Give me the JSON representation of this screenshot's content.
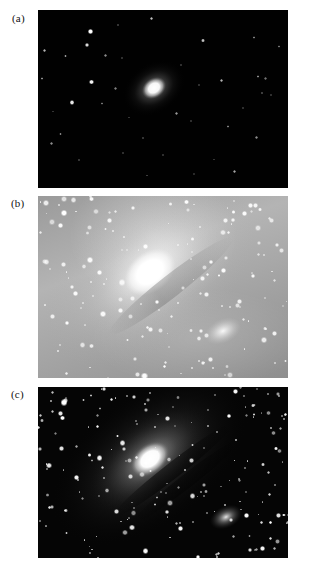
{
  "figure": {
    "background_color": "#ffffff",
    "panels": [
      {
        "id": "a",
        "label": "(a)",
        "description": "short exposure — only the bright nucleus and brightest foreground stars visible against a black sky",
        "sky_color": "#010101",
        "core_color": "#ffffff",
        "x": 38,
        "y": 10,
        "width": 250,
        "height": 178,
        "galaxy": {
          "core_cx_pct": 46.5,
          "core_cy_pct": 44.0,
          "core_rx_px": 11,
          "core_ry_px": 9,
          "halo_rx_px": 33,
          "halo_ry_px": 25,
          "tilt_deg": -35
        },
        "stars": [
          {
            "x": 21.0,
            "y": 12.0,
            "r": 2.8,
            "b": 1.0
          },
          {
            "x": 19.5,
            "y": 19.5,
            "r": 2.0,
            "b": 0.85
          },
          {
            "x": 11.0,
            "y": 26.0,
            "r": 1.2,
            "b": 0.6
          },
          {
            "x": 2.5,
            "y": 22.5,
            "r": 1.5,
            "b": 0.7
          },
          {
            "x": 1.5,
            "y": 38.5,
            "r": 1.2,
            "b": 0.55
          },
          {
            "x": 32.0,
            "y": 8.5,
            "r": 1.0,
            "b": 0.45
          },
          {
            "x": 45.5,
            "y": 5.0,
            "r": 1.6,
            "b": 0.75
          },
          {
            "x": 27.0,
            "y": 25.5,
            "r": 1.3,
            "b": 0.55
          },
          {
            "x": 33.5,
            "y": 27.0,
            "r": 0.9,
            "b": 0.4
          },
          {
            "x": 21.5,
            "y": 40.5,
            "r": 2.4,
            "b": 0.95
          },
          {
            "x": 31.0,
            "y": 44.0,
            "r": 1.2,
            "b": 0.5
          },
          {
            "x": 25.5,
            "y": 52.5,
            "r": 1.1,
            "b": 0.45
          },
          {
            "x": 13.5,
            "y": 52.0,
            "r": 2.2,
            "b": 0.9
          },
          {
            "x": 9.0,
            "y": 69.5,
            "r": 1.2,
            "b": 0.5
          },
          {
            "x": 5.5,
            "y": 75.0,
            "r": 1.3,
            "b": 0.55
          },
          {
            "x": 16.5,
            "y": 84.5,
            "r": 1.1,
            "b": 0.45
          },
          {
            "x": 34.0,
            "y": 80.5,
            "r": 1.0,
            "b": 0.4
          },
          {
            "x": 42.0,
            "y": 72.0,
            "r": 1.1,
            "b": 0.45
          },
          {
            "x": 55.5,
            "y": 58.0,
            "r": 1.4,
            "b": 0.6
          },
          {
            "x": 50.0,
            "y": 81.5,
            "r": 1.0,
            "b": 0.4
          },
          {
            "x": 66.0,
            "y": 17.0,
            "r": 1.7,
            "b": 0.75
          },
          {
            "x": 64.5,
            "y": 42.0,
            "r": 1.0,
            "b": 0.4
          },
          {
            "x": 73.5,
            "y": 39.5,
            "r": 1.6,
            "b": 0.7
          },
          {
            "x": 88.0,
            "y": 37.5,
            "r": 1.3,
            "b": 0.55
          },
          {
            "x": 91.0,
            "y": 38.5,
            "r": 1.1,
            "b": 0.45
          },
          {
            "x": 89.5,
            "y": 46.5,
            "r": 1.2,
            "b": 0.5
          },
          {
            "x": 93.0,
            "y": 48.0,
            "r": 1.0,
            "b": 0.4
          },
          {
            "x": 86.5,
            "y": 15.5,
            "r": 1.2,
            "b": 0.5
          },
          {
            "x": 96.5,
            "y": 20.5,
            "r": 1.1,
            "b": 0.45
          },
          {
            "x": 82.0,
            "y": 55.0,
            "r": 1.0,
            "b": 0.4
          },
          {
            "x": 76.0,
            "y": 65.5,
            "r": 1.2,
            "b": 0.5
          },
          {
            "x": 87.5,
            "y": 71.5,
            "r": 1.3,
            "b": 0.55
          },
          {
            "x": 78.5,
            "y": 90.5,
            "r": 1.5,
            "b": 0.65
          },
          {
            "x": 61.0,
            "y": 62.5,
            "r": 1.0,
            "b": 0.4
          },
          {
            "x": 57.0,
            "y": 31.0,
            "r": 1.0,
            "b": 0.4
          },
          {
            "x": 62.5,
            "y": 92.0,
            "r": 0.9,
            "b": 0.35
          },
          {
            "x": 43.5,
            "y": 93.0,
            "r": 0.9,
            "b": 0.35
          },
          {
            "x": 6.0,
            "y": 57.0,
            "r": 0.8,
            "b": 0.3
          },
          {
            "x": 36.5,
            "y": 60.5,
            "r": 0.8,
            "b": 0.3
          },
          {
            "x": 70.5,
            "y": 84.0,
            "r": 0.8,
            "b": 0.3
          }
        ]
      },
      {
        "id": "b",
        "label": "(b)",
        "description": "long overexposed exposure — washed-out grey sky, galaxy disk saturated, dense field of stars",
        "sky_color": "#a8a8a8",
        "core_color": "#ffffff",
        "x": 38,
        "y": 196,
        "width": 250,
        "height": 182,
        "galaxy": {
          "core_cx_pct": 45.0,
          "core_cy_pct": 42.0,
          "core_rx_px": 26,
          "core_ry_px": 19,
          "halo_rx_px": 120,
          "halo_ry_px": 74,
          "tilt_deg": -38
        },
        "companion": {
          "x_pct": 74.0,
          "y_pct": 74.0,
          "rx_px": 18,
          "ry_px": 11
        },
        "star_count": 150,
        "star_color": "#ffffff"
      },
      {
        "id": "c",
        "label": "(c)",
        "description": "correct exposure — spiral arms, dust lanes and two companion galaxies visible on a dark sky",
        "sky_color": "#050505",
        "core_color": "#ffffff",
        "x": 38,
        "y": 387,
        "width": 250,
        "height": 171,
        "galaxy": {
          "core_cx_pct": 45.0,
          "core_cy_pct": 42.0,
          "core_rx_px": 20,
          "core_ry_px": 14,
          "halo_rx_px": 112,
          "halo_ry_px": 66,
          "tilt_deg": -38
        },
        "companion": {
          "x_pct": 75.0,
          "y_pct": 76.0,
          "rx_px": 16,
          "ry_px": 10
        },
        "bright_stars": [
          {
            "x": 10.5,
            "y": 9.0,
            "r": 3.2,
            "b": 1.0
          },
          {
            "x": 9.0,
            "y": 15.5,
            "r": 2.4,
            "b": 0.9
          },
          {
            "x": 1.5,
            "y": 19.5,
            "r": 1.8,
            "b": 0.7
          },
          {
            "x": 24.5,
            "y": 41.5,
            "r": 2.6,
            "b": 0.95
          },
          {
            "x": 15.5,
            "y": 53.0,
            "r": 2.6,
            "b": 0.95
          },
          {
            "x": 38.5,
            "y": 6.0,
            "r": 2.0,
            "b": 0.8
          },
          {
            "x": 77.0,
            "y": 77.5,
            "r": 2.0,
            "b": 0.8
          }
        ],
        "star_count": 185,
        "star_color": "#ffffff"
      }
    ]
  }
}
